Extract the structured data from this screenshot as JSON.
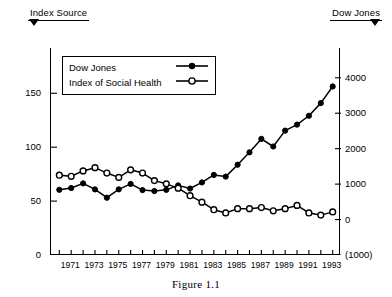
{
  "annotations": {
    "left": {
      "label": "Index Source",
      "icon": "down-triangle-arrow"
    },
    "right": {
      "label": "Dow Jones",
      "icon": "down-triangle-arrow"
    }
  },
  "legend": {
    "position": "top-left-inside",
    "entries": [
      {
        "label": "Dow Jones",
        "marker": "filled-circle",
        "axis": "right"
      },
      {
        "label": "Index of Social Health",
        "marker": "open-circle",
        "axis": "left"
      }
    ]
  },
  "caption": "Figure 1.1",
  "colors": {
    "line": "#000000",
    "axis": "#000000",
    "background": "#ffffff",
    "marker_fill_dow": "#000000",
    "marker_fill_ish": "#ffffff"
  },
  "chart_data": {
    "type": "line",
    "title": "",
    "subtitle": "",
    "xlabel": "",
    "ylabel": "",
    "grid": false,
    "legend_position": "upper left",
    "x": [
      1970,
      1971,
      1972,
      1973,
      1974,
      1975,
      1976,
      1977,
      1978,
      1979,
      1980,
      1981,
      1982,
      1983,
      1984,
      1985,
      1986,
      1987,
      1988,
      1989,
      1990,
      1991,
      1992,
      1993
    ],
    "xlim": [
      1969.3,
      1993.7
    ],
    "xticks": [
      1971,
      1973,
      1975,
      1977,
      1979,
      1981,
      1983,
      1985,
      1987,
      1989,
      1991,
      1993
    ],
    "xticklabels": [
      "1971",
      "1973",
      "1975",
      "1977",
      "1979",
      "1981",
      "1983",
      "1985",
      "1987",
      "1989",
      "1991",
      "1993"
    ],
    "xticks_minor": [
      1970,
      1972,
      1974,
      1976,
      1978,
      1980,
      1982,
      1984,
      1986,
      1988,
      1990,
      1992
    ],
    "axes": [
      {
        "id": "left",
        "name": "Index Source",
        "ylim": [
          0,
          192
        ],
        "yticks": [
          0,
          50,
          100,
          150
        ],
        "yticklabels": [
          "0",
          "50",
          "100",
          "150"
        ]
      },
      {
        "id": "right",
        "name": "Dow Jones",
        "ylim": [
          -1000,
          4840
        ],
        "yticks": [
          -1000,
          0,
          1000,
          2000,
          3000,
          4000
        ],
        "yticklabels": [
          "(1000)",
          "0",
          "1000",
          "2000",
          "3000",
          "4000"
        ]
      }
    ],
    "series": [
      {
        "name": "Dow Jones",
        "axis": "right",
        "marker": "filled-circle",
        "values": [
          840,
          890,
          1020,
          850,
          616,
          852,
          1005,
          831,
          805,
          838,
          964,
          875,
          1047,
          1259,
          1212,
          1547,
          1896,
          2276,
          2061,
          2509,
          2679,
          2929,
          3285,
          3755
        ]
      },
      {
        "name": "Index of Social Health",
        "axis": "left",
        "marker": "open-circle",
        "values": [
          74,
          73,
          78,
          81,
          76,
          72,
          79,
          76,
          69,
          66,
          62,
          55,
          49,
          42,
          39,
          43,
          43,
          44,
          41,
          43,
          46,
          39,
          37,
          40
        ]
      }
    ]
  }
}
